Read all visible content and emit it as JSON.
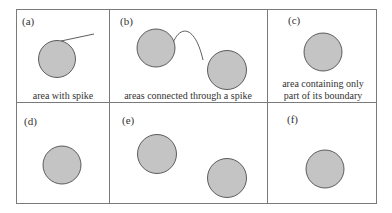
{
  "figure": {
    "panels": [
      {
        "id": "a",
        "label": "(a)",
        "caption": [
          "area with spike"
        ]
      },
      {
        "id": "b",
        "label": "(b)",
        "caption": [
          "areas connected through a spike"
        ]
      },
      {
        "id": "c",
        "label": "(c)",
        "caption": [
          "area containing only",
          "part of its boundary"
        ]
      },
      {
        "id": "d",
        "label": "(d)",
        "caption": []
      },
      {
        "id": "e",
        "label": "(e)",
        "caption": []
      },
      {
        "id": "f",
        "label": "(f)",
        "caption": []
      }
    ],
    "colors": {
      "fill": "#c4c4c4",
      "stroke": "#3a3a3a",
      "grid": "#777777"
    }
  }
}
